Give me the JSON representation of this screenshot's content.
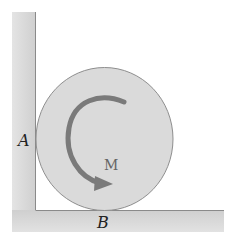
{
  "figure": {
    "type": "statics-diagram",
    "labels": {
      "contact_wall": "A",
      "contact_floor": "B",
      "moment": "M"
    },
    "moment_direction": "counterclockwise",
    "colors": {
      "wall_fill": "#d6d6d6",
      "wall_edge": "#8a8a8a",
      "disk_fill": "#dadada",
      "disk_edge": "#8e8e8e",
      "arrow": "#7a7a7a",
      "label_text": "#222222",
      "moment_label": "#666666"
    }
  }
}
